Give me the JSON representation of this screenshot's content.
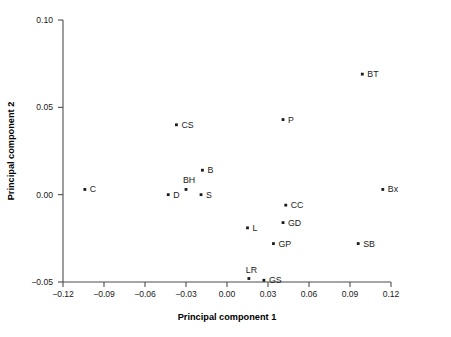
{
  "chart_data": {
    "type": "scatter",
    "title": "",
    "xlabel": "Principal component 1",
    "ylabel": "Principal component 2",
    "xlim": [
      -0.12,
      0.12
    ],
    "ylim": [
      -0.05,
      0.1
    ],
    "xticks": [
      "-0.12",
      "-0.09",
      "-0.06",
      "-0.03",
      "0.00",
      "0.03",
      "0.06",
      "0.09",
      "0.12"
    ],
    "xtick_values": [
      -0.12,
      -0.09,
      -0.06,
      -0.03,
      0.0,
      0.03,
      0.06,
      0.09,
      0.12
    ],
    "yticks": [
      "0.10",
      "0.05",
      "0.00",
      "-0.05"
    ],
    "ytick_values": [
      0.1,
      0.05,
      0.0,
      -0.05
    ],
    "grid": false,
    "legend": "none",
    "marker_color": "#1a1a1a",
    "axis_color": "#4d4d4d",
    "points": [
      {
        "label": "BT",
        "x": 0.099,
        "y": 0.069,
        "label_dx": 5,
        "label_dy": 3
      },
      {
        "label": "P",
        "x": 0.041,
        "y": 0.043,
        "label_dx": 5,
        "label_dy": 3
      },
      {
        "label": "CS",
        "x": -0.037,
        "y": 0.04,
        "label_dx": 5,
        "label_dy": 3
      },
      {
        "label": "B",
        "x": -0.018,
        "y": 0.014,
        "label_dx": 5,
        "label_dy": 3
      },
      {
        "label": "BH",
        "x": -0.03,
        "y": 0.003,
        "label_dx": -3,
        "label_dy": -6
      },
      {
        "label": "C",
        "x": -0.104,
        "y": 0.003,
        "label_dx": 5,
        "label_dy": 3
      },
      {
        "label": "Bx",
        "x": 0.114,
        "y": 0.003,
        "label_dx": 5,
        "label_dy": 3
      },
      {
        "label": "D",
        "x": -0.043,
        "y": 0.0,
        "label_dx": 5,
        "label_dy": 3
      },
      {
        "label": "S",
        "x": -0.019,
        "y": 0.0,
        "label_dx": 5,
        "label_dy": 3
      },
      {
        "label": "CC",
        "x": 0.043,
        "y": -0.006,
        "label_dx": 5,
        "label_dy": 3
      },
      {
        "label": "GD",
        "x": 0.041,
        "y": -0.016,
        "label_dx": 5,
        "label_dy": 3
      },
      {
        "label": "L",
        "x": 0.015,
        "y": -0.019,
        "label_dx": 5,
        "label_dy": 3
      },
      {
        "label": "GP",
        "x": 0.034,
        "y": -0.028,
        "label_dx": 5,
        "label_dy": 3
      },
      {
        "label": "SB",
        "x": 0.096,
        "y": -0.028,
        "label_dx": 5,
        "label_dy": 3
      },
      {
        "label": "LR",
        "x": 0.016,
        "y": -0.048,
        "label_dx": -3,
        "label_dy": -6
      },
      {
        "label": "GS",
        "x": 0.027,
        "y": -0.049,
        "label_dx": 5,
        "label_dy": 3
      }
    ]
  }
}
